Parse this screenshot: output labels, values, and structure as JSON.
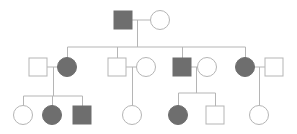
{
  "diagram": {
    "type": "pedigree",
    "colors": {
      "affected": "#6e6e6e",
      "line": "#b5b5b5",
      "unaffected_fill": "#ffffff"
    },
    "individuals": [
      {
        "id": "I-1",
        "sex": "male",
        "affected": true,
        "x": 123,
        "y": 20
      },
      {
        "id": "I-2",
        "sex": "female",
        "affected": false,
        "x": 160,
        "y": 20
      },
      {
        "id": "II-1",
        "sex": "male",
        "affected": false,
        "x": 38,
        "y": 67
      },
      {
        "id": "II-2",
        "sex": "female",
        "affected": true,
        "x": 67,
        "y": 67
      },
      {
        "id": "II-3",
        "sex": "male",
        "affected": false,
        "x": 117,
        "y": 67
      },
      {
        "id": "II-4",
        "sex": "female",
        "affected": false,
        "x": 146,
        "y": 67
      },
      {
        "id": "II-5",
        "sex": "male",
        "affected": true,
        "x": 182,
        "y": 67
      },
      {
        "id": "II-6",
        "sex": "female",
        "affected": false,
        "x": 207,
        "y": 67
      },
      {
        "id": "II-7",
        "sex": "female",
        "affected": true,
        "x": 245,
        "y": 67
      },
      {
        "id": "II-8",
        "sex": "male",
        "affected": false,
        "x": 274,
        "y": 67
      },
      {
        "id": "III-1",
        "sex": "female",
        "affected": false,
        "x": 23,
        "y": 115
      },
      {
        "id": "III-2",
        "sex": "female",
        "affected": true,
        "x": 52,
        "y": 115
      },
      {
        "id": "III-3",
        "sex": "male",
        "affected": true,
        "x": 82,
        "y": 115
      },
      {
        "id": "III-4",
        "sex": "female",
        "affected": false,
        "x": 132,
        "y": 115
      },
      {
        "id": "III-5",
        "sex": "female",
        "affected": true,
        "x": 178,
        "y": 115
      },
      {
        "id": "III-6",
        "sex": "male",
        "affected": false,
        "x": 215,
        "y": 115
      },
      {
        "id": "III-7",
        "sex": "female",
        "affected": false,
        "x": 259,
        "y": 115
      }
    ]
  }
}
